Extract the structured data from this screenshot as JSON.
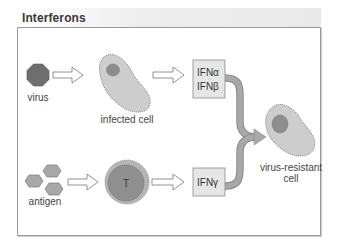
{
  "title": "Interferons",
  "colors": {
    "frame_border": "#9a9a9a",
    "cell_fill": "#cdcdcd",
    "cell_dot_border": "#666666",
    "nucleus_fill": "#8c8c8c",
    "virus_fill": "#6e6e6e",
    "antigen_fill": "#a8a8a8",
    "tcell_outer": "#b5b5b5",
    "tcell_inner": "#8f8f8f",
    "ifn_box_fill": "#e6e6e6",
    "ifn_box_border": "#8a8a8a",
    "merge_arrow": "#a3a3a3"
  },
  "nodes": {
    "virus": {
      "label": "virus",
      "icon": "octagon-virus-icon"
    },
    "infected_cell": {
      "label": "infected cell",
      "icon": "cell-icon"
    },
    "ifn_ab": {
      "line1": "IFNα",
      "line2": "IFNβ"
    },
    "antigen": {
      "label": "antigen",
      "icon": "hexagon-cluster-icon"
    },
    "t_cell": {
      "label": "T",
      "icon": "t-cell-icon"
    },
    "ifn_g": {
      "label": "IFNγ"
    },
    "resistant_cell": {
      "line1": "virus-resistant",
      "line2": "cell",
      "icon": "cell-icon"
    }
  },
  "edges": [
    {
      "from": "virus",
      "to": "infected_cell",
      "style": "open-arrow"
    },
    {
      "from": "infected_cell",
      "to": "ifn_ab",
      "style": "open-arrow"
    },
    {
      "from": "antigen",
      "to": "t_cell",
      "style": "open-arrow"
    },
    {
      "from": "t_cell",
      "to": "ifn_g",
      "style": "open-arrow"
    },
    {
      "from": "ifn_ab",
      "to": "resistant_cell",
      "style": "merge-arrow"
    },
    {
      "from": "ifn_g",
      "to": "resistant_cell",
      "style": "merge-arrow"
    }
  ]
}
